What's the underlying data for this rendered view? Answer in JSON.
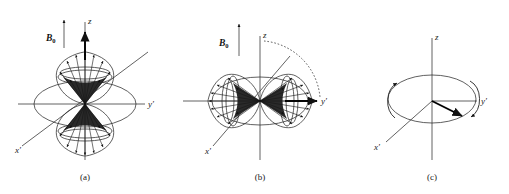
{
  "figure": {
    "background_color": "#ffffff",
    "ink_color": "#1a1a1a",
    "panel_count": 3
  },
  "panels": [
    {
      "id": "a",
      "caption": "(a)",
      "field_label": "B",
      "field_subscript": "0",
      "field_arrow": "up",
      "axes": [
        {
          "name": "z-axis",
          "label": "z",
          "direction": "up"
        },
        {
          "name": "y-prime-axis",
          "label": "y′",
          "direction": "right"
        },
        {
          "name": "x-prime-axis",
          "label": "x′",
          "direction": "lower-left"
        }
      ],
      "magnetization": {
        "label": "",
        "direction": "along +z",
        "style": "bold-arrow"
      },
      "lobes": "double-cone along z with elliptical rims and radiating spoke arrows",
      "equator_ellipse": true
    },
    {
      "id": "b",
      "caption": "(b)",
      "field_label": "B",
      "field_subscript": "0",
      "field_arrow": "up",
      "axes": [
        {
          "name": "z-axis",
          "label": "z",
          "direction": "up"
        },
        {
          "name": "y-prime-axis",
          "label": "y′",
          "direction": "right"
        },
        {
          "name": "x-prime-axis",
          "label": "x′",
          "direction": "lower-left"
        }
      ],
      "magnetization": {
        "label": "",
        "direction": "along +y′",
        "style": "bold-arrow"
      },
      "lobes": "double-cone along y′ with elliptical rims and radiating spoke arrows",
      "equator_ellipse": true,
      "rotation_arc": {
        "style": "dotted",
        "from": "z",
        "to": "y′",
        "sweep_degrees": 90
      }
    },
    {
      "id": "c",
      "caption": "(c)",
      "field_label": "",
      "field_subscript": "",
      "field_arrow": "",
      "axes": [
        {
          "name": "z-axis",
          "label": "z",
          "direction": "up"
        },
        {
          "name": "y-prime-axis",
          "label": "y′",
          "direction": "right"
        },
        {
          "name": "x-prime-axis",
          "label": "x′",
          "direction": "lower-left"
        }
      ],
      "magnetization": {
        "label": "",
        "direction": "in x′y′ plane, toward lower right",
        "style": "bold-arrow"
      },
      "transverse_plane_ellipse": true,
      "precession_arrows": [
        {
          "name": "left-precession-arrow",
          "direction": "up"
        },
        {
          "name": "right-precession-arrow",
          "direction": "down"
        }
      ]
    }
  ]
}
